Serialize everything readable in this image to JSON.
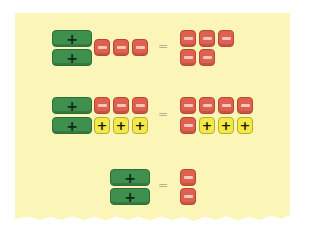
{
  "diagram": {
    "colors": {
      "paper": "#fbf6b8",
      "positive_x": "#3f8f4e",
      "negative_unit": "#e0604f",
      "positive_unit": "#f3ea4a"
    },
    "symbols": {
      "plus": "+",
      "minus": "−",
      "equals": "="
    },
    "equations": [
      {
        "left": "2 positive x-tiles + 3 negative unit tiles",
        "right": "5 negative unit tiles"
      },
      {
        "left": "2 positive x-tiles + 3 negative unit tiles + 3 positive unit tiles",
        "right": "5 negative unit tiles + 3 positive unit tiles"
      },
      {
        "left": "2 positive x-tiles",
        "right": "2 negative unit tiles"
      }
    ]
  }
}
